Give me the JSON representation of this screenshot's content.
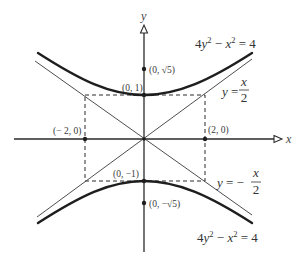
{
  "figure": {
    "axes": {
      "x_label": "x",
      "y_label": "y"
    },
    "points": {
      "vertex_top": "(0, 1)",
      "focus_top": "(0, √5)",
      "left": "(− 2, 0)",
      "right": "(2, 0)",
      "vertex_bottom": "(0, −1)",
      "focus_bottom": "(0, −√5)"
    },
    "hyperbola": {
      "equation": "4y² − x² = 4",
      "parts": [
        "4",
        "y",
        "2",
        " − ",
        "x",
        "2",
        " = 4"
      ]
    },
    "asymptote_positive": {
      "equation": "y = x/2",
      "lhs": "y",
      "eq": " =",
      "num": "x",
      "den": "2"
    },
    "asymptote_negative": {
      "equation": "y = −x/2",
      "lhs": "y",
      "eq": " = −",
      "num": "x",
      "den": "2"
    },
    "colors": {
      "ink": "#1e1e1e",
      "background": "#ffffff"
    }
  }
}
